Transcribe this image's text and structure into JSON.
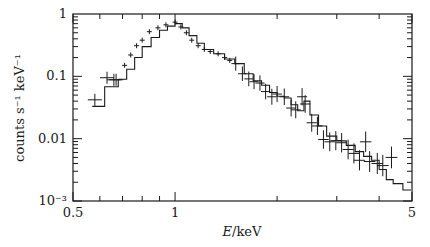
{
  "chart_data": {
    "type": "line",
    "subtype": "step-histogram-with-errorbars",
    "title": "",
    "xlabel": "E/keV",
    "xlabel_italic_part": "E",
    "xlabel_rest": "/keV",
    "ylabel": "counts s⁻¹ keV⁻¹",
    "xscale": "log",
    "yscale": "log",
    "xlim": [
      0.5,
      5
    ],
    "ylim": [
      0.001,
      1
    ],
    "grid": false,
    "legend": null,
    "x_ticks": [
      {
        "value": 0.5,
        "label": "0.5"
      },
      {
        "value": 1,
        "label": "1"
      },
      {
        "value": 5,
        "label": "5"
      }
    ],
    "y_ticks": [
      {
        "value": 1,
        "label": "1"
      },
      {
        "value": 0.1,
        "label": "0.1"
      },
      {
        "value": 0.01,
        "label": "0.01"
      },
      {
        "value": 0.001,
        "label": "10⁻³"
      }
    ],
    "series": [
      {
        "name": "data",
        "style": "crosses",
        "x": [
          0.58,
          0.63,
          0.66,
          0.67,
          0.71,
          0.74,
          0.77,
          0.8,
          0.84,
          0.89,
          0.94,
          1.0,
          1.04,
          1.08,
          1.12,
          1.17,
          1.22,
          1.27,
          1.34,
          1.4,
          1.45,
          1.51,
          1.58,
          1.65,
          1.71,
          1.78,
          1.85,
          1.93,
          2.0,
          2.1,
          2.2,
          2.27,
          2.37,
          2.42,
          2.53,
          2.63,
          2.74,
          2.86,
          2.98,
          3.1,
          3.24,
          3.37,
          3.5,
          3.65,
          3.75,
          3.95,
          4.1,
          4.35
        ],
        "values": [
          0.042,
          0.095,
          0.088,
          0.088,
          0.15,
          0.22,
          0.31,
          0.38,
          0.52,
          0.6,
          0.67,
          0.74,
          0.62,
          0.5,
          0.38,
          0.31,
          0.27,
          0.25,
          0.23,
          0.2,
          0.18,
          0.16,
          0.11,
          0.091,
          0.082,
          0.078,
          0.057,
          0.047,
          0.052,
          0.047,
          0.031,
          0.029,
          0.047,
          0.036,
          0.018,
          0.016,
          0.0097,
          0.0089,
          0.0093,
          0.0086,
          0.0067,
          0.0058,
          0.0045,
          0.0089,
          0.0043,
          0.004,
          0.0037,
          0.005
        ]
      },
      {
        "name": "model",
        "style": "step",
        "x": [
          0.57,
          0.62,
          0.68,
          0.72,
          0.76,
          0.8,
          0.85,
          0.9,
          0.95,
          1.0,
          1.05,
          1.1,
          1.16,
          1.22,
          1.3,
          1.4,
          1.5,
          1.6,
          1.7,
          1.8,
          1.9,
          2.0,
          2.1,
          2.2,
          2.3,
          2.4,
          2.5,
          2.65,
          2.8,
          3.0,
          3.2,
          3.4,
          3.6,
          3.8,
          4.0,
          4.2,
          4.4,
          4.7
        ],
        "values": [
          0.033,
          0.068,
          0.09,
          0.13,
          0.2,
          0.3,
          0.42,
          0.55,
          0.64,
          0.7,
          0.6,
          0.45,
          0.34,
          0.27,
          0.23,
          0.19,
          0.16,
          0.11,
          0.085,
          0.072,
          0.055,
          0.048,
          0.045,
          0.035,
          0.028,
          0.04,
          0.024,
          0.016,
          0.011,
          0.0092,
          0.0078,
          0.0062,
          0.0052,
          0.0045,
          0.0032,
          0.0022,
          0.0019,
          0.0015
        ]
      }
    ]
  }
}
